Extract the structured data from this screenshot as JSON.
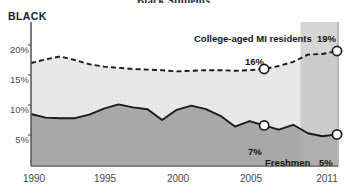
{
  "chart_data": {
    "type": "area",
    "title": "Black Students",
    "ylabel": "BLACK",
    "xlabel": "",
    "ylim": [
      0,
      22.5
    ],
    "xlim": [
      1990,
      2011
    ],
    "grid": true,
    "legend_position": "inline-annotations",
    "yticks": [
      "5%",
      "10%",
      "15%",
      "20%"
    ],
    "ytick_values": [
      5,
      10,
      15,
      20
    ],
    "xticks": [
      "1990",
      "1995",
      "2000",
      "2005",
      "2011"
    ],
    "xtick_values": [
      1990,
      1995,
      2000,
      2005,
      2011
    ],
    "x": [
      1990,
      1991,
      1992,
      1993,
      1994,
      1995,
      1996,
      1997,
      1998,
      1999,
      2000,
      2001,
      2002,
      2003,
      2004,
      2005,
      2006,
      2007,
      2008,
      2009,
      2010,
      2011
    ],
    "series": [
      {
        "name": "College-aged MI residents",
        "style": "dashed",
        "fill": "#e8e8e8",
        "values": [
          17.0,
          17.6,
          18.1,
          17.5,
          16.8,
          16.4,
          16.2,
          16.0,
          15.9,
          15.8,
          15.6,
          15.7,
          15.8,
          15.8,
          15.7,
          15.8,
          16.0,
          16.5,
          17.2,
          18.4,
          18.5,
          19.0
        ]
      },
      {
        "name": "Freshmen",
        "style": "solid",
        "fill": "#a8a8a8",
        "values": [
          8.5,
          7.9,
          7.8,
          7.8,
          8.4,
          9.4,
          10.1,
          9.6,
          9.3,
          7.5,
          9.2,
          9.9,
          9.3,
          8.2,
          6.4,
          7.3,
          6.6,
          5.9,
          6.7,
          5.3,
          4.8,
          5.1
        ]
      }
    ],
    "shaded_band": {
      "from": 2008.5,
      "to": 2011,
      "color": "#b5b5b5"
    },
    "annotations": [
      {
        "id": "residents-label",
        "text": "College-aged MI residents",
        "x": 2006.3,
        "y": 21.6
      },
      {
        "id": "residents-end-value",
        "text": "19%",
        "x": 2011.0,
        "y": 21.6
      },
      {
        "id": "residents-mid-value",
        "text": "16%",
        "x": 2005.8,
        "y": 17.7
      },
      {
        "id": "freshmen-mid-value",
        "text": "7%",
        "x": 2005.9,
        "y": 4.2
      },
      {
        "id": "freshmen-label",
        "text": "Freshmen",
        "x": 2009.3,
        "y": 2.5
      },
      {
        "id": "freshmen-end-value",
        "text": "5%",
        "x": 2011.0,
        "y": 2.5
      }
    ],
    "markers": [
      {
        "id": "marker-residents-2006",
        "x": 2006.0,
        "y": 16.0,
        "series": "College-aged MI residents"
      },
      {
        "id": "marker-residents-2011",
        "x": 2011.0,
        "y": 19.0,
        "series": "College-aged MI residents"
      },
      {
        "id": "marker-freshmen-2006",
        "x": 2006.0,
        "y": 6.6,
        "series": "Freshmen"
      },
      {
        "id": "marker-freshmen-2011",
        "x": 2011.0,
        "y": 5.1,
        "series": "Freshmen"
      }
    ],
    "colors": {
      "residents_fill": "#e8e8e8",
      "freshmen_fill": "#a8a8a8",
      "band": "#b5b5b5",
      "line": "#1a1a1a",
      "axis": "#5a5a5a",
      "tick_text": "#4a4a4a"
    }
  }
}
